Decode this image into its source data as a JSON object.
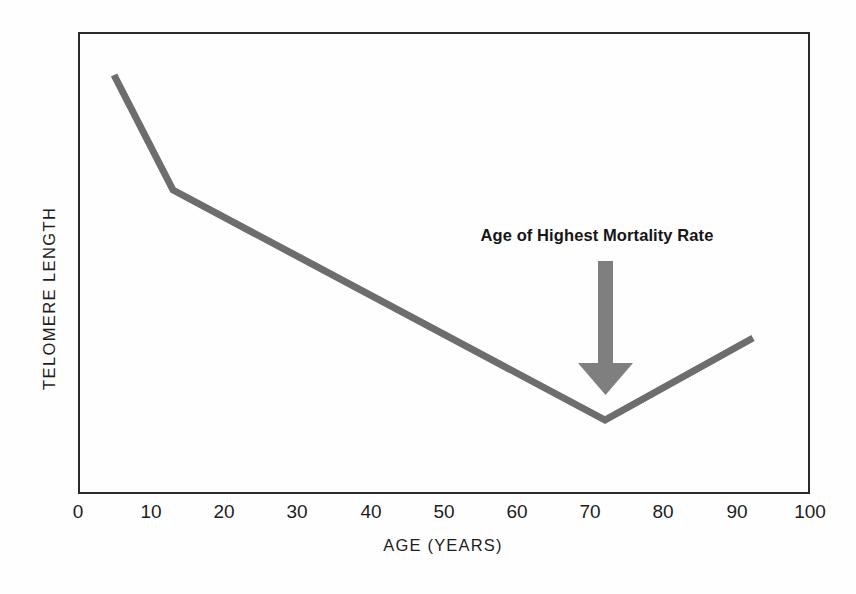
{
  "figure": {
    "background_color": "#fefefe",
    "frame_color": "#2b2b2b",
    "line_color": "#6d6d6d",
    "arrow_color": "#7b7b7b",
    "text_color": "#1d1d1d"
  },
  "chart_data": {
    "type": "line",
    "title": "",
    "xlabel": "AGE (YEARS)",
    "ylabel": "TELOMERE LENGTH",
    "xlim": [
      0,
      100
    ],
    "ylim": [
      0,
      100
    ],
    "grid": false,
    "legend": "none",
    "x_ticks": [
      0,
      10,
      20,
      30,
      40,
      50,
      60,
      70,
      80,
      90,
      100
    ],
    "x_tick_labels": [
      "0",
      "10",
      "20",
      "30",
      "40",
      "50",
      "60",
      "70",
      "80",
      "90",
      "100"
    ],
    "y_ticks": [],
    "y_tick_labels": [],
    "series": [
      {
        "name": "Telomere length",
        "x": [
          5,
          13,
          72,
          95
        ],
        "y": [
          91,
          66,
          16,
          34
        ]
      }
    ],
    "annotations": [
      {
        "text": "Age of Highest Mortality Rate",
        "x": 72,
        "y": 53,
        "arrow_to_x": 72,
        "arrow_to_y": 22,
        "style": "bold",
        "arrow": "down-arrow"
      }
    ]
  },
  "axis": {
    "x_label": "AGE (YEARS)",
    "y_label": "TELOMERE LENGTH",
    "x_ticks": [
      {
        "label": "0",
        "pos": 78
      },
      {
        "label": "10",
        "pos": 151
      },
      {
        "label": "20",
        "pos": 224
      },
      {
        "label": "30",
        "pos": 297
      },
      {
        "label": "40",
        "pos": 371
      },
      {
        "label": "50",
        "pos": 444
      },
      {
        "label": "60",
        "pos": 517
      },
      {
        "label": "70",
        "pos": 590
      },
      {
        "label": "80",
        "pos": 663
      },
      {
        "label": "90",
        "pos": 737
      },
      {
        "label": "100",
        "pos": 810
      }
    ]
  },
  "annotation": {
    "label": "Age of Highest Mortality Rate"
  },
  "icons": {
    "arrow": "down-arrow-icon"
  }
}
